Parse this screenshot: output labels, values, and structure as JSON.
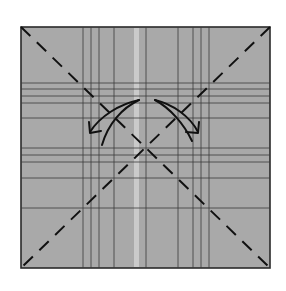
{
  "diagram": {
    "type": "origami-step",
    "colors": {
      "background": "#ffffff",
      "paper": "#a9a9a9",
      "border": "#2a2a2a",
      "crease": "#3a3a3a",
      "valley_line": "#111111",
      "arrow": "#111111",
      "highlight_strip": "#d2d2d2"
    },
    "square": {
      "x": 21,
      "y": 27,
      "width": 249,
      "height": 241
    },
    "vertical_creases": [
      83,
      91,
      99,
      114,
      146,
      178,
      193,
      201,
      209
    ],
    "horizontal_creases": [
      83,
      89,
      96,
      103,
      118,
      148,
      155,
      162,
      178,
      208
    ],
    "light_strip": {
      "x": 134,
      "width": 5
    },
    "valley_folds": [
      {
        "name": "diagonal-top-left-to-bottom-right",
        "x1": 21,
        "y1": 27,
        "x2": 270,
        "y2": 268
      },
      {
        "name": "diagonal-top-right-to-bottom-left",
        "x1": 270,
        "y1": 27,
        "x2": 21,
        "y2": 268
      }
    ],
    "arrows": [
      {
        "name": "left-fold-arrow",
        "direction": "down-left"
      },
      {
        "name": "right-fold-arrow",
        "direction": "down-right"
      }
    ]
  }
}
